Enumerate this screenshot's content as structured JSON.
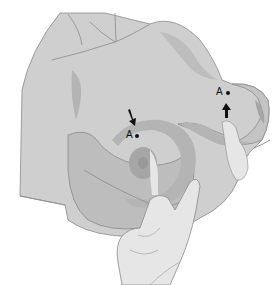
{
  "figure": {
    "type": "medical-illustration",
    "colors": {
      "background": "#ffffff",
      "skin": "#cfcfcf",
      "skin_shadow": "#bdbdbd",
      "band": "#b4b4b4",
      "areola": "#a6a6a6",
      "nipple": "#999999",
      "hand": "#e6e6e6",
      "outline": "#8a8a8a",
      "marker": "#111111"
    },
    "labels": [
      {
        "id": "label-a-front",
        "text": "A"
      },
      {
        "id": "label-a-side",
        "text": "A"
      }
    ],
    "markers": [
      {
        "id": "arrow-front",
        "direction": "down-right"
      },
      {
        "id": "arrow-side",
        "direction": "up"
      }
    ],
    "signature": {
      "present": true
    }
  }
}
